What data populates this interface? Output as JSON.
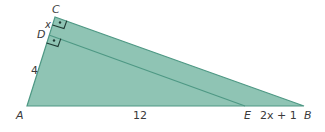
{
  "diagram": {
    "type": "geometry-triangle",
    "colors": {
      "fill": "#8fc4b4",
      "fill_inner": "#9ccabc",
      "edge": "#4e9884",
      "label": "#3a3a3a",
      "right_angle_marker": "#1f3a33"
    },
    "points": {
      "A": {
        "label": "A",
        "x": 27,
        "y": 106
      },
      "B": {
        "label": "B",
        "x": 304,
        "y": 106
      },
      "C": {
        "label": "C",
        "x": 55,
        "y": 17
      },
      "D": {
        "label": "D",
        "x": 49,
        "y": 35
      },
      "E": {
        "label": "E",
        "x": 245,
        "y": 106
      }
    },
    "segments": [
      {
        "from": "A",
        "to": "B"
      },
      {
        "from": "B",
        "to": "C"
      },
      {
        "from": "C",
        "to": "A"
      },
      {
        "from": "D",
        "to": "E"
      }
    ],
    "lengths": {
      "CD": "x",
      "AD": "4",
      "AE": "12",
      "EB": "2x + 1"
    },
    "right_angles": [
      "C",
      "D"
    ]
  }
}
